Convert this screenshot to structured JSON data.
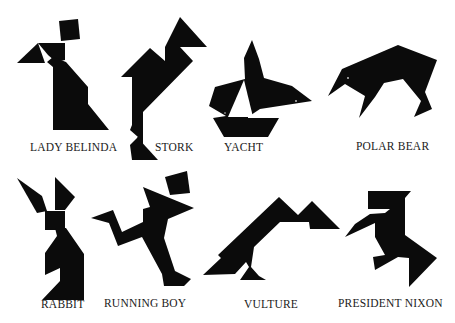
{
  "colors": {
    "ink": "#0b0b0b",
    "paper": "#ffffff",
    "label": "#1a1a1a"
  },
  "figures": [
    {
      "name": "LADY BELINDA",
      "row": 1
    },
    {
      "name": "STORK",
      "row": 1
    },
    {
      "name": "YACHT",
      "row": 1
    },
    {
      "name": "POLAR BEAR",
      "row": 1
    },
    {
      "name": "RABBIT",
      "row": 2
    },
    {
      "name": "RUNNING BOY",
      "row": 2
    },
    {
      "name": "VULTURE",
      "row": 2
    },
    {
      "name": "PRESIDENT NIXON",
      "row": 2
    }
  ]
}
